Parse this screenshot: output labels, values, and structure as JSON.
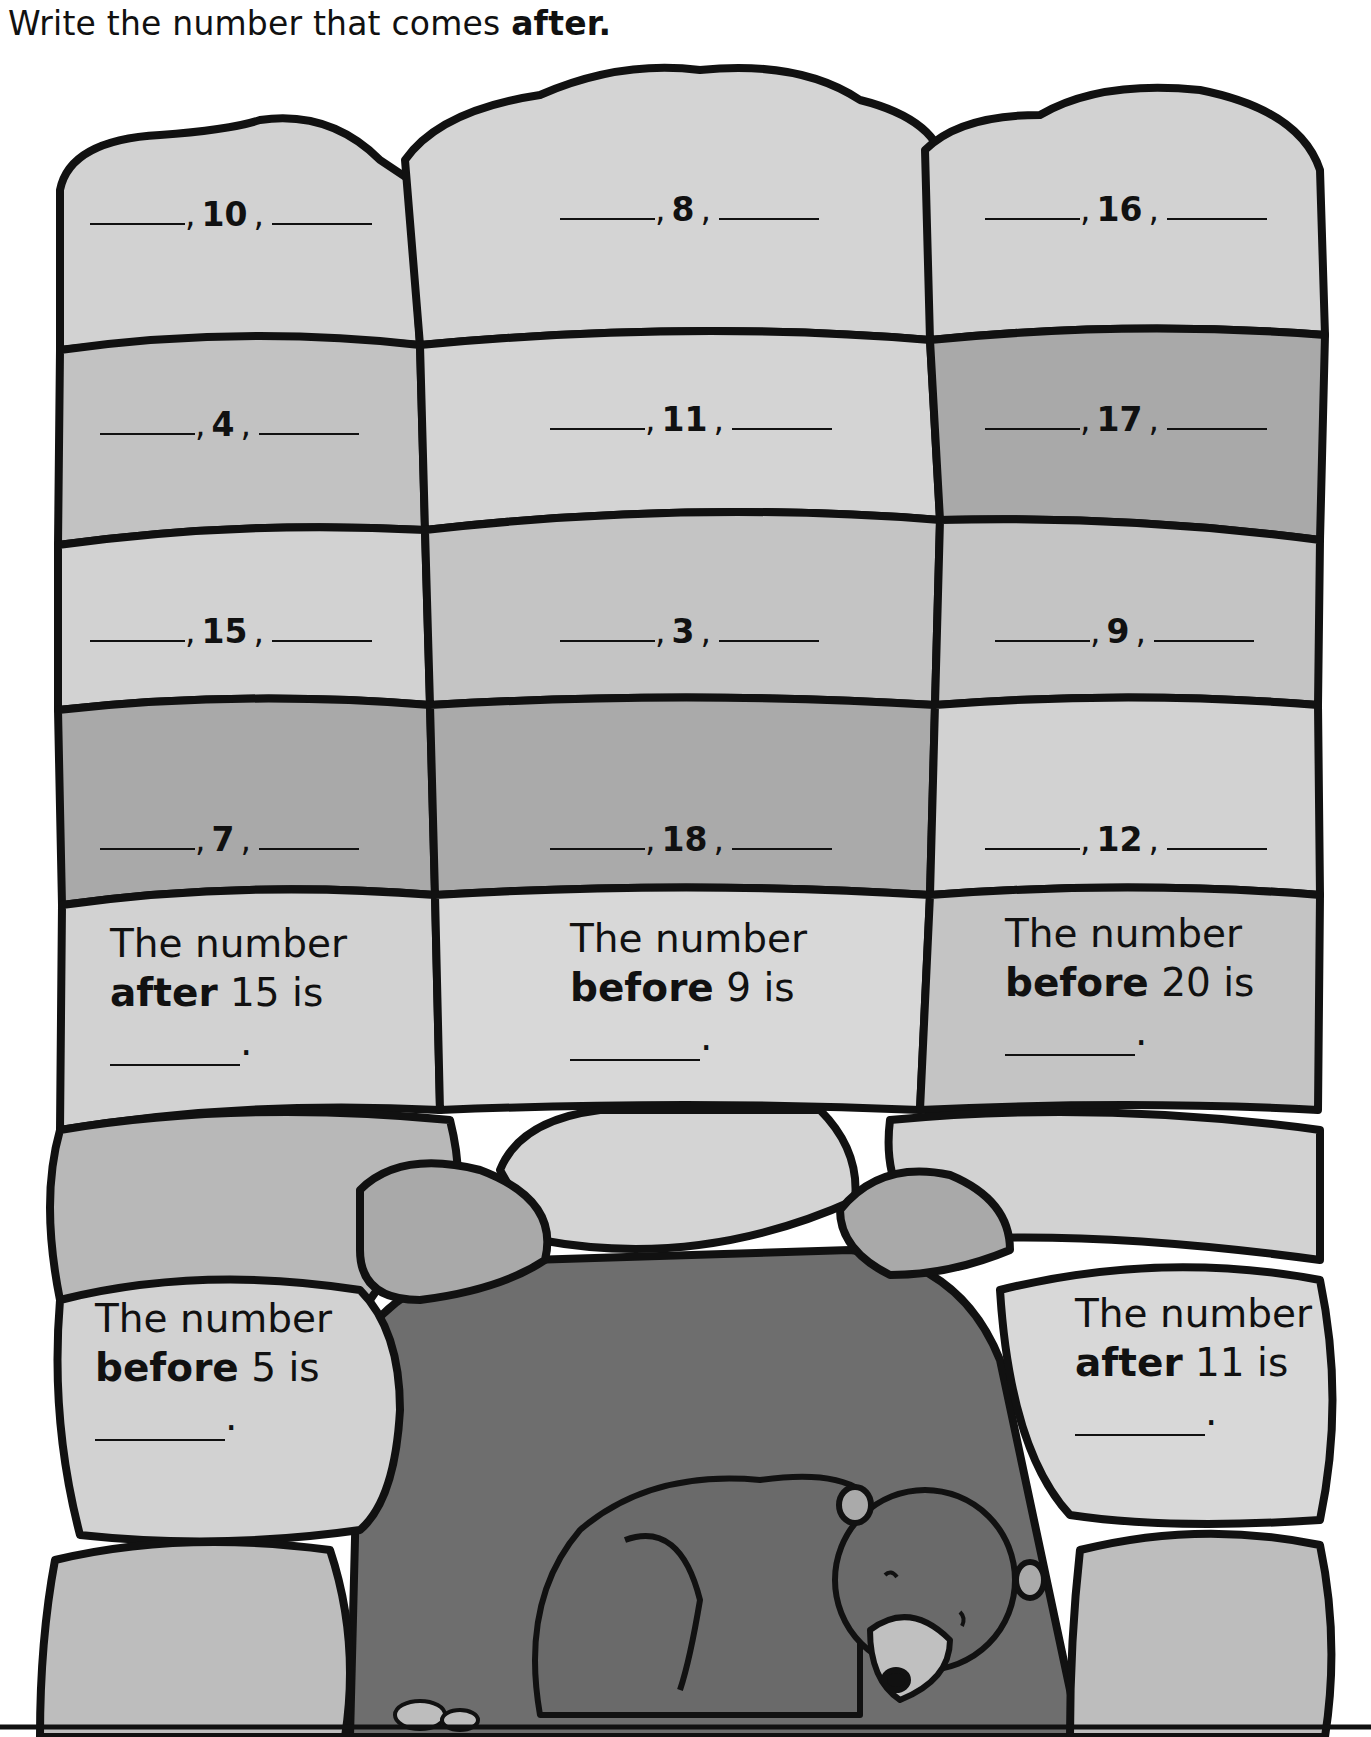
{
  "instruction": {
    "text": "Write the number that comes ",
    "bold": "after."
  },
  "sequence_stones": [
    {
      "row": 1,
      "col": 1,
      "number": "10"
    },
    {
      "row": 1,
      "col": 2,
      "number": "8"
    },
    {
      "row": 1,
      "col": 3,
      "number": "16"
    },
    {
      "row": 2,
      "col": 1,
      "number": "4"
    },
    {
      "row": 2,
      "col": 2,
      "number": "11"
    },
    {
      "row": 2,
      "col": 3,
      "number": "17"
    },
    {
      "row": 3,
      "col": 1,
      "number": "15"
    },
    {
      "row": 3,
      "col": 2,
      "number": "3"
    },
    {
      "row": 3,
      "col": 3,
      "number": "9"
    },
    {
      "row": 4,
      "col": 1,
      "number": "7"
    },
    {
      "row": 4,
      "col": 2,
      "number": "18"
    },
    {
      "row": 4,
      "col": 3,
      "number": "12"
    }
  ],
  "prompts": [
    {
      "line1": "The number",
      "keyword": "after",
      "value": "15 is"
    },
    {
      "line1": "The number",
      "keyword": "before",
      "value": "9 is"
    },
    {
      "line1": "The number",
      "keyword": "before",
      "value": "20 is"
    },
    {
      "line1": "The number",
      "keyword": "before",
      "value": "5 is"
    },
    {
      "line1": "The number",
      "keyword": "after",
      "value": "11 is"
    }
  ],
  "illustration": {
    "subject": "sleeping bear in cave"
  },
  "colors": {
    "stone_light": "#d4d4d4",
    "stone_mid": "#c4c4c4",
    "stone_dark": "#a9a9a9",
    "cave": "#6e6e6e",
    "bear": "#6a6a6a",
    "outline": "#111111"
  }
}
